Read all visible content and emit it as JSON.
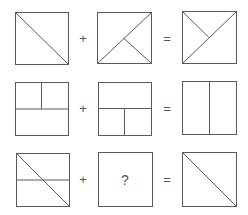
{
  "puzzle": {
    "type": "visual-analogy",
    "line_color": "#5a5a5a",
    "operators": {
      "plus": "+",
      "equals": "="
    },
    "rows": [
      {
        "label": "row-1",
        "operand_a": "square with diagonal from top-left to bottom-right",
        "operand_b": "square with diagonal from bottom-left to top-right plus segment from center to bottom-right",
        "result": "square with diagonal from bottom-left to top-right plus segment from top-left to center"
      },
      {
        "label": "row-2",
        "operand_a": "square with horizontal midline and vertical line in top half",
        "operand_b": "square with horizontal midline and vertical line in bottom half",
        "result": "square with full vertical midline"
      },
      {
        "label": "row-3",
        "operand_a": "square with horizontal midline and diagonal from top-left to bottom-right",
        "operand_b": "unknown",
        "result": "square with diagonal from top-left to bottom-right"
      }
    ],
    "unknown_symbol": "?"
  }
}
